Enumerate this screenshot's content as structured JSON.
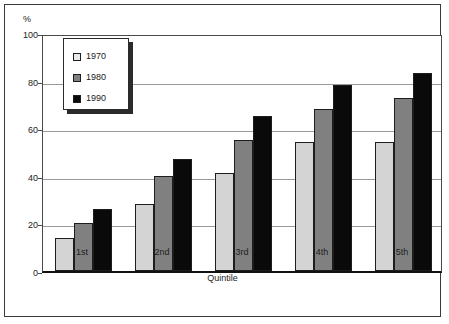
{
  "chart_data": {
    "type": "bar",
    "title": "",
    "subtitle": "",
    "xlabel": "Quintile",
    "ylabel": "%",
    "unit_label": "%",
    "categories": [
      "1st",
      "2nd",
      "3rd",
      "4th",
      "5th"
    ],
    "series": [
      {
        "name": "1970",
        "color": "#d4d4d4",
        "values": [
          14,
          28,
          41,
          54,
          54
        ]
      },
      {
        "name": "1980",
        "color": "#808080",
        "values": [
          20,
          40,
          55,
          68,
          72.5
        ]
      },
      {
        "name": "1990",
        "color": "#0a0a0a",
        "values": [
          26,
          47,
          65,
          78,
          83
        ]
      }
    ],
    "ylim": [
      0,
      100
    ],
    "yticks": [
      0,
      20,
      40,
      60,
      80,
      100
    ],
    "ytick_labels": [
      "0",
      "20",
      "40",
      "60",
      "80",
      "100"
    ],
    "grid": "horizontal",
    "legend_position": "upper-left-inside",
    "legend_entries": [
      "1970",
      "1980",
      "1990"
    ]
  },
  "axis": {
    "y_label": "%",
    "x_title": "Quintile"
  }
}
